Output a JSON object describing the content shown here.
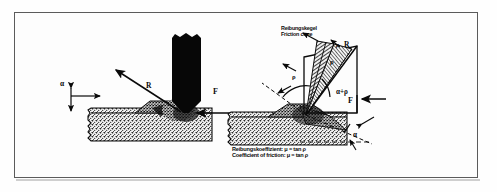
{
  "figure": {
    "title_visible": false,
    "background": "#fdfdfd",
    "frame_color": "#5b5b5b",
    "ink_color": "#0a0a0a"
  },
  "left_diagram": {
    "name": "cutting-tool-resultant-force",
    "labels": {
      "rake_angle": "α",
      "resultant_force": "R",
      "cutting_force": "F"
    }
  },
  "right_diagram": {
    "name": "friction-cone-diagram",
    "callout": {
      "line_de": "Reibungskegel",
      "line_en": "Friction cone"
    },
    "labels": {
      "resultant_force": "R",
      "friction_angle": "ρ",
      "friction_angle_cone": "ρ",
      "friction_angle_left": "ρ",
      "combined_angle": "α+ρ",
      "cutting_force": "F",
      "rake_angle": "α"
    },
    "formula": {
      "line_de": "Reibungskoeffizient:  μ = tan ρ",
      "line_en": "Coefficient of friction:  μ = tan ρ"
    }
  }
}
